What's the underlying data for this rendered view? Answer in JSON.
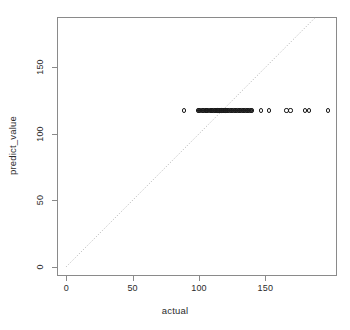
{
  "chart_data": {
    "type": "scatter",
    "title": "",
    "xlabel": "actual",
    "ylabel": "predict_value",
    "xlim": [
      -7,
      204
    ],
    "ylim": [
      -7,
      188
    ],
    "xticks": [
      0,
      50,
      100,
      150
    ],
    "yticks": [
      0,
      50,
      100,
      150
    ],
    "xticklabels": [
      "0",
      "50",
      "100",
      "150"
    ],
    "yticklabels": [
      "0",
      "50",
      "100",
      "150"
    ],
    "grid": false,
    "legend": null,
    "annotations": [
      {
        "name": "identity-reference-line",
        "style": "dotted",
        "color": "#b0b0b0",
        "from": [
          0,
          0
        ],
        "to": [
          188,
          188
        ],
        "description": "dotted diagonal y = x reference line"
      }
    ],
    "marker": {
      "shape": "open-circle",
      "size": 4.2,
      "edge_color": "#1a1a1a",
      "fill": "none"
    },
    "series": [
      {
        "name": "predictions",
        "color": "#1a1a1a",
        "x": [
          89,
          99,
          100,
          101,
          102,
          103,
          104,
          105,
          105,
          106,
          107,
          108,
          109,
          110,
          110,
          111,
          112,
          112,
          113,
          114,
          114,
          115,
          116,
          117,
          117,
          118,
          119,
          120,
          120,
          121,
          122,
          123,
          124,
          125,
          126,
          127,
          128,
          129,
          130,
          131,
          132,
          133,
          134,
          135,
          136,
          137,
          138,
          139,
          140,
          147,
          153,
          166,
          169,
          180,
          183,
          197
        ],
        "y": [
          117.6,
          117.6,
          117.6,
          117.6,
          117.6,
          117.6,
          117.6,
          117.6,
          117.6,
          117.6,
          117.6,
          117.6,
          117.6,
          117.6,
          117.6,
          117.6,
          117.6,
          117.6,
          117.6,
          117.6,
          117.6,
          117.6,
          117.6,
          117.6,
          117.6,
          117.6,
          117.6,
          117.6,
          117.6,
          117.6,
          117.6,
          117.6,
          117.6,
          117.6,
          117.6,
          117.6,
          117.6,
          117.6,
          117.6,
          117.6,
          117.6,
          117.6,
          117.6,
          117.6,
          117.6,
          117.6,
          117.6,
          117.6,
          117.6,
          117.6,
          117.6,
          117.6,
          117.6,
          117.6,
          117.6,
          117.6
        ]
      }
    ]
  },
  "axes": {
    "x_label": "actual",
    "y_label": "predict_value"
  }
}
